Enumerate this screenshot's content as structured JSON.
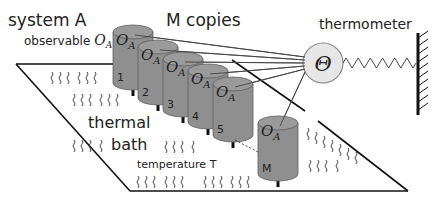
{
  "labels": {
    "system": "system A",
    "observable_prefix": "observable ",
    "observable_symbol": "O",
    "observable_sub": "A",
    "copies": "M copies",
    "thermometer": "thermometer",
    "theta": "Θ",
    "bath_line1": "thermal",
    "bath_line2": "bath",
    "temperature": "temperature T"
  },
  "copies": [
    {
      "index": "1",
      "top_label": "O",
      "top_sub": "A"
    },
    {
      "index": "2",
      "top_label": "O",
      "top_sub": "A"
    },
    {
      "index": "3",
      "top_label": "O",
      "top_sub": "A"
    },
    {
      "index": "4",
      "top_label": "O",
      "top_sub": "A"
    },
    {
      "index": "5",
      "top_label": "O",
      "top_sub": "A"
    },
    {
      "index": "M",
      "top_label": "O",
      "top_sub": "A"
    }
  ],
  "colors": {
    "cylinder": "#8f8f8f",
    "thermometer_bulb": "#e6e6e6",
    "lines": "#111111"
  }
}
